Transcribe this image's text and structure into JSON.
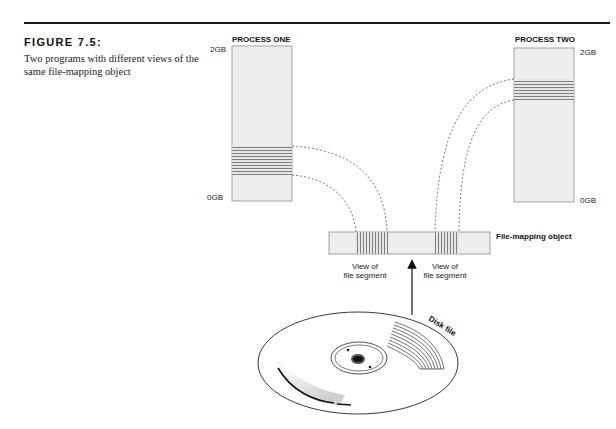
{
  "figure": {
    "title": "FIGURE 7.5:",
    "caption": "Two programs with different views of the same file-mapping object"
  },
  "process_one": {
    "label": "PROCESS ONE",
    "top_label": "2GB",
    "bottom_label": "0GB"
  },
  "process_two": {
    "label": "PROCESS TWO",
    "top_label": "2GB",
    "bottom_label": "0GB"
  },
  "file_mapping_object": {
    "label": "File-mapping object"
  },
  "segments": [
    {
      "label": "View of file segment",
      "line1": "View of",
      "line2": "file segment"
    },
    {
      "label": "View of file segment",
      "line1": "View of",
      "line2": "file segment"
    }
  ],
  "disk": {
    "label": "Disk file"
  },
  "colors": {
    "box_fill": "#eeeeee",
    "box_stroke": "#888888",
    "stripe": "#777777",
    "rule": "#1a1a1a"
  }
}
